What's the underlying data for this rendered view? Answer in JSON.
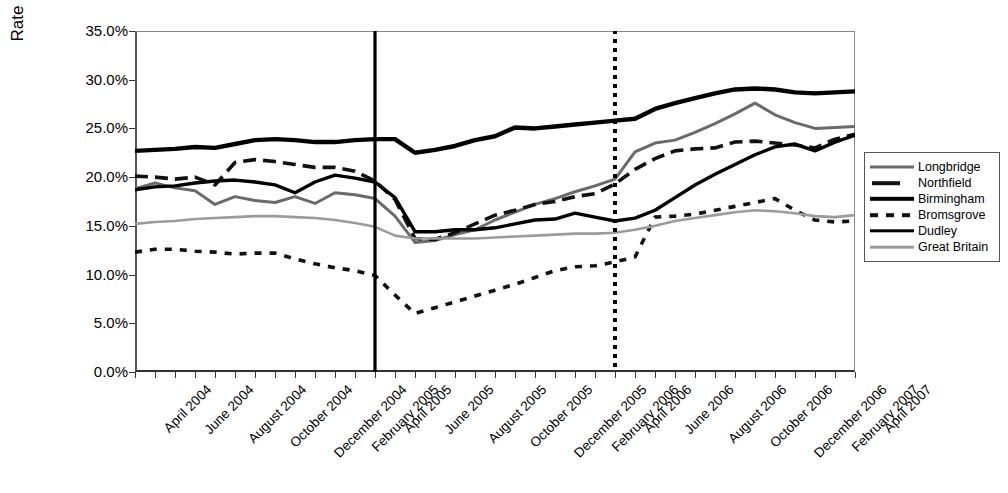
{
  "chart_data": {
    "type": "line",
    "title": "",
    "xlabel": "",
    "ylabel": "Rate (% of all JSA Claimants)",
    "ylim": [
      0,
      35
    ],
    "ytick_labels": [
      "35.0%",
      "30.0%",
      "25.0%",
      "20.0%",
      "15.0%",
      "10.0%",
      "5.0%",
      "0.0%"
    ],
    "ytick_values": [
      35,
      30,
      25,
      20,
      15,
      10,
      5,
      0
    ],
    "grid": false,
    "legend_position": "right",
    "x": [
      "April 2004",
      "May 2004",
      "June 2004",
      "July 2004",
      "August 2004",
      "September 2004",
      "October 2004",
      "November 2004",
      "December 2004",
      "January 2005",
      "February 2005",
      "March 2005",
      "April 2005",
      "May 2005",
      "June 2005",
      "July 2005",
      "August 2005",
      "September 2005",
      "October 2005",
      "November 2005",
      "December 2005",
      "January 2006",
      "February 2006",
      "March 2006",
      "April 2006",
      "May 2006",
      "June 2006",
      "July 2006",
      "August 2006",
      "September 2006",
      "October 2006",
      "November 2006",
      "December 2006",
      "January 2007",
      "February 2007",
      "March 2007",
      "April 2007"
    ],
    "xtick_labels": [
      "April 2004",
      "June 2004",
      "August 2004",
      "October 2004",
      "December 2004",
      "February 2005",
      "April 2005",
      "June 2005",
      "August 2005",
      "October 2005",
      "December 2005",
      "February 2006",
      "April 2006",
      "June 2006",
      "August 2006",
      "October 2006",
      "December 2006",
      "February 2007",
      "April 2007"
    ],
    "xtick_indices": [
      0,
      2,
      4,
      6,
      8,
      10,
      12,
      14,
      16,
      18,
      20,
      22,
      24,
      26,
      28,
      30,
      32,
      34,
      36
    ],
    "series": [
      {
        "name": "Longbridge",
        "style": "solid-medium-gray",
        "color": "#6a6a6a",
        "values": [
          18.8,
          19.4,
          18.9,
          18.6,
          17.2,
          18.0,
          17.6,
          17.4,
          18.0,
          17.3,
          18.4,
          18.2,
          17.8,
          16.0,
          13.3,
          13.5,
          14.1,
          14.6,
          15.6,
          16.4,
          17.2,
          17.8,
          18.5,
          19.1,
          19.8,
          22.6,
          23.5,
          23.8,
          24.6,
          25.5,
          26.5,
          27.6,
          26.4,
          25.6,
          25.0,
          25.1,
          25.2
        ]
      },
      {
        "name": "Northfield",
        "style": "long-dash",
        "color": "#111111",
        "values": [
          20.1,
          20.0,
          19.8,
          20.0,
          19.2,
          21.5,
          21.8,
          21.6,
          21.3,
          21.0,
          21.0,
          20.6,
          19.6,
          17.7,
          13.7,
          13.6,
          14.3,
          15.2,
          16.1,
          16.6,
          17.2,
          17.5,
          18.0,
          18.3,
          19.3,
          20.8,
          21.9,
          22.7,
          22.9,
          23.0,
          23.6,
          23.7,
          23.5,
          23.3,
          23.0,
          23.9,
          24.4
        ]
      },
      {
        "name": "Birmingham",
        "style": "solid-thick",
        "color": "#000000",
        "values": [
          22.7,
          22.8,
          22.9,
          23.1,
          23.0,
          23.4,
          23.8,
          23.9,
          23.8,
          23.6,
          23.6,
          23.8,
          23.9,
          23.9,
          22.5,
          22.8,
          23.2,
          23.8,
          24.2,
          25.1,
          25.0,
          25.2,
          25.4,
          25.6,
          25.8,
          26.0,
          27.0,
          27.6,
          28.1,
          28.6,
          29.0,
          29.1,
          29.0,
          28.7,
          28.6,
          28.7,
          28.8
        ]
      },
      {
        "name": "Bromsgrove",
        "style": "short-dash",
        "color": "#111111",
        "values": [
          12.3,
          12.6,
          12.6,
          12.4,
          12.3,
          12.1,
          12.2,
          12.2,
          11.6,
          11.1,
          10.7,
          10.4,
          9.9,
          7.9,
          6.0,
          6.6,
          7.2,
          7.8,
          8.4,
          9.0,
          9.7,
          10.4,
          10.8,
          10.9,
          11.3,
          11.8,
          15.9,
          16.0,
          16.2,
          16.6,
          17.0,
          17.4,
          17.8,
          16.6,
          15.6,
          15.4,
          15.5
        ]
      },
      {
        "name": "Dudley",
        "style": "solid-medium-black",
        "color": "#000000",
        "values": [
          18.7,
          19.0,
          19.1,
          19.4,
          19.6,
          19.7,
          19.5,
          19.2,
          18.4,
          19.5,
          20.2,
          19.9,
          19.5,
          17.9,
          14.4,
          14.4,
          14.6,
          14.6,
          14.8,
          15.2,
          15.6,
          15.7,
          16.3,
          15.9,
          15.5,
          15.8,
          16.6,
          17.9,
          19.2,
          20.3,
          21.3,
          22.3,
          23.1,
          23.4,
          22.7,
          23.6,
          24.3
        ]
      },
      {
        "name": "Great Britain",
        "style": "solid-thin-lightgray",
        "color": "#9b9b9b",
        "values": [
          15.2,
          15.4,
          15.5,
          15.7,
          15.8,
          15.9,
          16.0,
          16.0,
          15.9,
          15.8,
          15.6,
          15.3,
          14.9,
          14.0,
          13.7,
          13.7,
          13.7,
          13.7,
          13.8,
          13.9,
          14.0,
          14.1,
          14.2,
          14.2,
          14.3,
          14.6,
          15.0,
          15.5,
          15.8,
          16.1,
          16.4,
          16.6,
          16.5,
          16.3,
          16.0,
          15.9,
          16.1
        ]
      }
    ],
    "reference_lines": [
      {
        "name": "april-2005-marker",
        "x_index": 12,
        "style": "solid",
        "color": "#000000"
      },
      {
        "name": "april-2006-marker",
        "x_index": 24,
        "style": "dotted",
        "color": "#000000"
      }
    ]
  },
  "legend": {
    "items": [
      {
        "label": "Longbridge"
      },
      {
        "label": "Northfield"
      },
      {
        "label": "Birmingham"
      },
      {
        "label": "Bromsgrove"
      },
      {
        "label": "Dudley"
      },
      {
        "label": "Great Britain"
      }
    ]
  }
}
